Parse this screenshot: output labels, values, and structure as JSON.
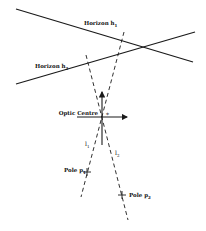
{
  "diagram": {
    "horizon_h1": {
      "label": "Horizon h",
      "sub": "1",
      "x1": 16,
      "y1": 9,
      "x2": 193,
      "y2": 62,
      "label_x": 84,
      "label_y": 25
    },
    "horizon_h2": {
      "label": "Horizon h",
      "sub": "2",
      "x1": 16,
      "y1": 84,
      "x2": 195,
      "y2": 32,
      "label_x": 35,
      "label_y": 68
    },
    "optic_centre": {
      "label": "Optic Centre",
      "x": 102,
      "y": 116,
      "label_x": 72,
      "label_y": 115,
      "star": "*"
    },
    "line_l1": {
      "label": "l",
      "sub": "1",
      "x1": 124,
      "y1": 32,
      "x2": 81,
      "y2": 197,
      "label_x": 85,
      "label_y": 146
    },
    "line_l2": {
      "label": "l",
      "sub": "2",
      "x1": 86,
      "y1": 55,
      "x2": 128,
      "y2": 220,
      "label_x": 115,
      "label_y": 155
    },
    "pole_p1": {
      "label": "Pole p",
      "sub": "1",
      "x": 87,
      "y": 172,
      "label_x": 64,
      "label_y": 172
    },
    "pole_p2": {
      "label": "Pole p",
      "sub": "2",
      "x": 122,
      "y": 195,
      "label_x": 129,
      "label_y": 197
    },
    "stroke_color": "#1a1a1a"
  }
}
